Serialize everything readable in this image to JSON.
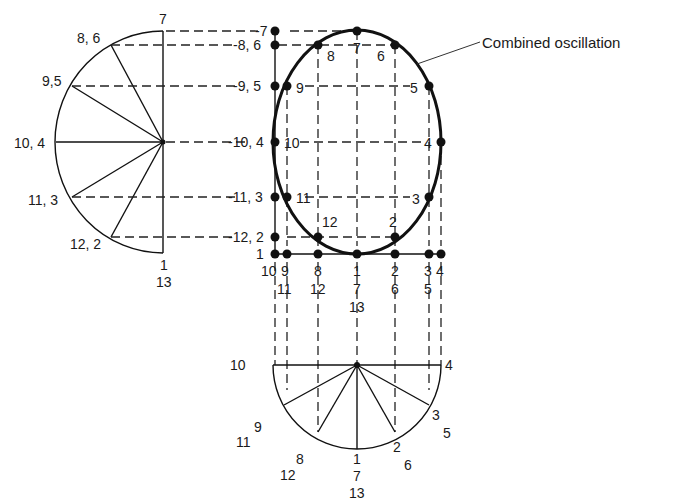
{
  "diagram": {
    "title": "Combined oscillation",
    "callout_label": "Combined oscillation",
    "left_phasor": {
      "labels": {
        "top": "7",
        "p86": "8, 6",
        "p95": "9,5",
        "p104": "10, 4",
        "p113": "11, 3",
        "p122": "12, 2",
        "bottom1": "1",
        "bottom2": "13"
      }
    },
    "vertical_axis_labels": {
      "l7": "-7",
      "l86": "-8, 6",
      "l95": "-9, 5",
      "l104": "-10, 4",
      "l113": "-11, 3",
      "l122": "-12, 2",
      "l1": "1"
    },
    "ellipse_point_labels": {
      "p7": "7",
      "p8": "8",
      "p6": "6",
      "p9": "9",
      "p5": "5",
      "p10": "10",
      "p4": "4",
      "p11": "11",
      "p3": "3",
      "p12": "12",
      "p2": "2"
    },
    "horizontal_axis_labels": {
      "c1": [
        "10",
        ""
      ],
      "c2": [
        "9",
        "11"
      ],
      "c3": [
        "8",
        "12"
      ],
      "c4": [
        "1",
        "7",
        "13"
      ],
      "c5": [
        "2",
        "6"
      ],
      "c6": [
        "3",
        "5"
      ],
      "c7": [
        "4"
      ]
    },
    "bottom_phasor": {
      "labels": {
        "left": "10",
        "right": "4",
        "p3": "3",
        "p5": "5",
        "p9": "9",
        "p11": "11",
        "p8": "8",
        "p12": "12",
        "p1": "1",
        "p7": "7",
        "p13": "13",
        "p2": "2",
        "p6": "6"
      }
    }
  }
}
